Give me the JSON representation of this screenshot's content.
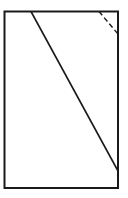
{
  "diagram": {
    "background": "#ffffff",
    "stroke_color": "#1a1a1a",
    "rectangle": {
      "x": 4.5,
      "y": 11.5,
      "width": 113.5,
      "height": 176.5,
      "stroke_width": 2
    },
    "diagonal_line": {
      "x1": 31,
      "y1": 11.5,
      "x2": 118,
      "y2": 171,
      "stroke_width": 1.6,
      "style": "solid"
    },
    "dashed_line": {
      "x1": 99,
      "y1": 11.5,
      "x2": 118,
      "y2": 34,
      "stroke_width": 1.4,
      "style": "dashed",
      "dasharray": "5,3"
    }
  }
}
